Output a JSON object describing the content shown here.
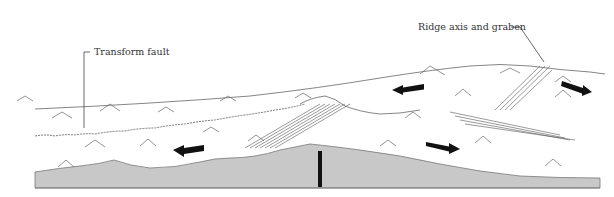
{
  "diagram": {
    "labels": {
      "transform_fault": "Transform fault",
      "ridge_axis": "Ridge axis and graben"
    },
    "colors": {
      "crust": "#c8c8c8",
      "line": "#555555",
      "arrow": "#111111",
      "background": "#ffffff"
    },
    "arrows": [
      {
        "id": "arrow-left-lower",
        "direction": "left"
      },
      {
        "id": "arrow-left-upper",
        "direction": "left"
      },
      {
        "id": "arrow-right-middle",
        "direction": "right"
      },
      {
        "id": "arrow-right-upper",
        "direction": "right"
      }
    ]
  }
}
